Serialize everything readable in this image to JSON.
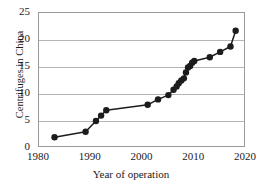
{
  "chart_data": {
    "type": "line",
    "title": "",
    "xlabel": "Year of operation",
    "ylabel": "Centrifuges in China",
    "xlim": [
      1980,
      2020
    ],
    "ylim": [
      0,
      25
    ],
    "xticks": [
      1980,
      1990,
      2000,
      2010,
      2020
    ],
    "yticks": [
      0,
      5,
      10,
      15,
      20,
      25
    ],
    "grid": "horizontal",
    "legend": "none",
    "marker": "filled-circle",
    "marker_color": "#1c1c1c",
    "line_color": "#1c1c1c",
    "frame_color": "#9a9a9a",
    "gridline_color": "#b5b5b5",
    "background": "#ffffff",
    "x": [
      1983,
      1989,
      1991,
      1992,
      1993,
      2001,
      2003,
      2005,
      2006,
      2006.6,
      2007,
      2007.5,
      2008,
      2008.4,
      2008.8,
      2009.2,
      2009.6,
      2010,
      2013,
      2015,
      2017,
      2018
    ],
    "values": [
      2.0,
      3.0,
      5.0,
      6.0,
      7.0,
      8.0,
      9.0,
      9.8,
      10.8,
      11.4,
      12.0,
      12.5,
      12.9,
      14.0,
      14.9,
      15.2,
      15.8,
      16.1,
      16.8,
      17.8,
      18.8,
      21.7
    ],
    "points": [
      {
        "year": 1983,
        "value": 2.0
      },
      {
        "year": 1989,
        "value": 3.0
      },
      {
        "year": 1991,
        "value": 5.0
      },
      {
        "year": 1992,
        "value": 6.0
      },
      {
        "year": 1993,
        "value": 7.0
      },
      {
        "year": 2001,
        "value": 8.0
      },
      {
        "year": 2003,
        "value": 9.0
      },
      {
        "year": 2005,
        "value": 9.8
      },
      {
        "year": 2006,
        "value": 10.8
      },
      {
        "year": 2006.6,
        "value": 11.4
      },
      {
        "year": 2007,
        "value": 12.0
      },
      {
        "year": 2007.5,
        "value": 12.5
      },
      {
        "year": 2008,
        "value": 12.9
      },
      {
        "year": 2008.4,
        "value": 14.0
      },
      {
        "year": 2008.8,
        "value": 14.9
      },
      {
        "year": 2009.2,
        "value": 15.2
      },
      {
        "year": 2009.6,
        "value": 15.8
      },
      {
        "year": 2010,
        "value": 16.1
      },
      {
        "year": 2013,
        "value": 16.8
      },
      {
        "year": 2015,
        "value": 17.8
      },
      {
        "year": 2017,
        "value": 18.8
      },
      {
        "year": 2018,
        "value": 21.7
      }
    ]
  },
  "axis": {
    "y_title": "Centrifuges in China",
    "x_title": "Year of operation",
    "y_tick_labels": [
      "25",
      "20",
      "15",
      "10",
      "5",
      "0"
    ],
    "x_tick_labels": [
      "1980",
      "1990",
      "2000",
      "2010",
      "2020"
    ]
  }
}
